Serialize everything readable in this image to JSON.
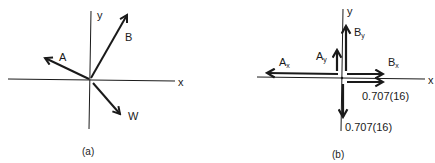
{
  "figure": {
    "panel_a": {
      "caption": "(a)",
      "axis_x_label": "x",
      "axis_y_label": "y",
      "vectors": [
        {
          "name": "A",
          "label": "A",
          "direction": "up-left"
        },
        {
          "name": "B",
          "label": "B",
          "direction": "up-right"
        },
        {
          "name": "W",
          "label": "W",
          "direction": "down-right"
        }
      ]
    },
    "panel_b": {
      "caption": "(b)",
      "axis_x_label": "x",
      "axis_y_label": "y",
      "components": [
        {
          "name": "Ax",
          "label": "A",
          "subscript": "x",
          "direction": "left"
        },
        {
          "name": "Ay",
          "label": "A",
          "subscript": "y",
          "direction": "up"
        },
        {
          "name": "By",
          "label": "B",
          "subscript": "y",
          "direction": "up"
        },
        {
          "name": "Bx",
          "label": "B",
          "subscript": "x",
          "direction": "right"
        },
        {
          "name": "Wx",
          "label": "0.707(16)",
          "direction": "right"
        },
        {
          "name": "Wy",
          "label": "0.707(16)",
          "direction": "down"
        }
      ]
    }
  }
}
